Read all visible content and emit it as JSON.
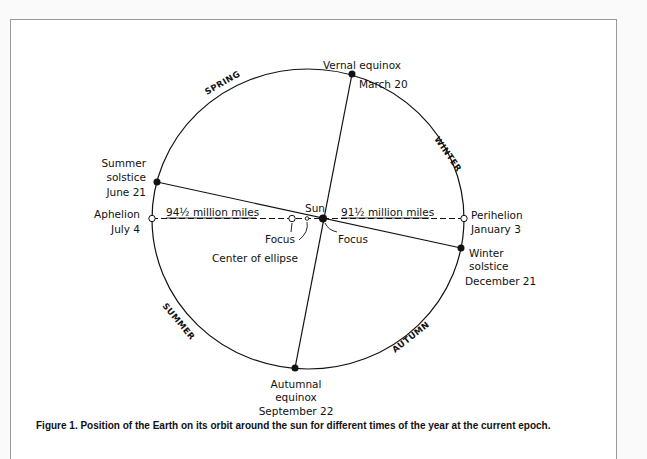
{
  "figure": {
    "caption": "Figure 1. Position of the Earth on its orbit around the sun for different times of the year at the current epoch."
  },
  "diagram": {
    "seasons": {
      "spring": "SPRING",
      "winter": "WINTER",
      "summer": "SUMMER",
      "autumn": "AUTUMN"
    },
    "points": {
      "vernal": {
        "line1": "Vernal equinox",
        "line2": "March 20"
      },
      "summer_solstice": {
        "line1": "Summer",
        "line2": "solstice",
        "line3": "June 21"
      },
      "aphelion": {
        "line1": "Aphelion",
        "line2": "July 4"
      },
      "perihelion": {
        "line1": "Perihelion",
        "line2": "January 3"
      },
      "winter_solstice": {
        "line1": "Winter",
        "line2": "solstice",
        "line3": "December 21"
      },
      "autumnal": {
        "line1": "Autumnal",
        "line2": "equinox",
        "line3": "September 22"
      }
    },
    "sun": "Sun",
    "aphelion_distance": "94½ million miles",
    "perihelion_distance": "91½ million miles",
    "focus_left": "Focus",
    "focus_right": "Focus",
    "center_of_ellipse": "Center of ellipse"
  },
  "colors": {
    "line": "#111111",
    "frame_border": "#9a9a9a",
    "background": "#ffffff"
  }
}
